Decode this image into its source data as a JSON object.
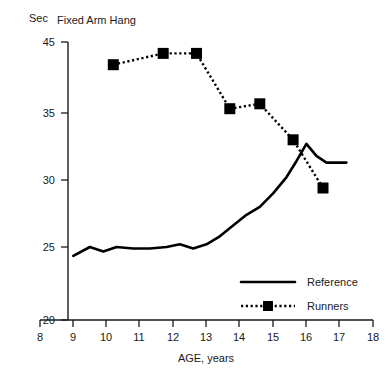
{
  "chart_data": {
    "type": "line",
    "title": "Fixed Arm Hang",
    "xlabel": "AGE, years",
    "ylabel": "Sec",
    "ylim": [
      20,
      45
    ],
    "xlim": [
      8,
      18
    ],
    "grid": false,
    "legend_position": "inside-lower-right",
    "x_ticks": [
      8,
      9,
      10,
      11,
      12,
      13,
      14,
      15,
      16,
      17,
      18
    ],
    "y_ticks": [
      20,
      25,
      30,
      35,
      45
    ],
    "y_axis_note": "non-linear: 35 to 45 compressed into same span as 30 to 35",
    "series": [
      {
        "name": "Reference",
        "style": "solid-line",
        "x": [
          9.0,
          9.5,
          9.9,
          10.3,
          10.8,
          11.3,
          11.8,
          12.2,
          12.6,
          13.0,
          13.4,
          13.8,
          14.2,
          14.6,
          15.0,
          15.4,
          15.7,
          16.0,
          16.3,
          16.6,
          17.2
        ],
        "y": [
          24.4,
          25.0,
          24.7,
          25.0,
          24.9,
          24.9,
          25.0,
          25.2,
          24.9,
          25.2,
          25.8,
          26.6,
          27.4,
          28.0,
          29.0,
          30.2,
          31.4,
          32.7,
          31.8,
          31.3,
          31.3
        ]
      },
      {
        "name": "Runners",
        "style": "dotted-line-square-markers",
        "x": [
          10.2,
          11.7,
          12.7,
          13.7,
          14.6,
          15.6,
          16.5
        ],
        "y": [
          41.8,
          43.4,
          43.4,
          35.6,
          36.3,
          33.0,
          29.4
        ]
      }
    ],
    "legend": [
      {
        "label": "Reference",
        "style": "solid-line"
      },
      {
        "label": "Runners",
        "style": "dotted-line-square-markers"
      }
    ]
  }
}
